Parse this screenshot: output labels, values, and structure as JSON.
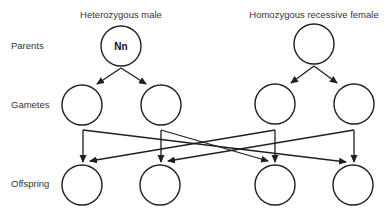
{
  "headers": {
    "male": "Heterozygous male",
    "female": "Homozygous recessive female"
  },
  "row_labels": {
    "parents": "Parents",
    "gametes": "Gametes",
    "offspring": "Offspring"
  },
  "parents": [
    {
      "id": "male",
      "genotype": "Nn"
    },
    {
      "id": "female",
      "genotype": ""
    }
  ],
  "gametes": [
    {
      "id": "g1",
      "parent": "male",
      "allele": ""
    },
    {
      "id": "g2",
      "parent": "male",
      "allele": ""
    },
    {
      "id": "g3",
      "parent": "female",
      "allele": ""
    },
    {
      "id": "g4",
      "parent": "female",
      "allele": ""
    }
  ],
  "offspring": [
    {
      "id": "o1",
      "genotype": ""
    },
    {
      "id": "o2",
      "genotype": ""
    },
    {
      "id": "o3",
      "genotype": ""
    },
    {
      "id": "o4",
      "genotype": ""
    }
  ],
  "connections": [
    {
      "from": "male",
      "to": "g1"
    },
    {
      "from": "male",
      "to": "g2"
    },
    {
      "from": "female",
      "to": "g3"
    },
    {
      "from": "female",
      "to": "g4"
    },
    {
      "from": "g1",
      "to": "o1"
    },
    {
      "from": "g1",
      "to": "o4"
    },
    {
      "from": "g2",
      "to": "o2"
    },
    {
      "from": "g2",
      "to": "o3"
    },
    {
      "from": "g3",
      "to": "o3"
    },
    {
      "from": "g3",
      "to": "o1"
    },
    {
      "from": "g4",
      "to": "o4"
    },
    {
      "from": "g4",
      "to": "o2"
    }
  ],
  "colors": {
    "stroke": "#1f1f1f",
    "text": "#333333",
    "background": "#ffffff"
  }
}
